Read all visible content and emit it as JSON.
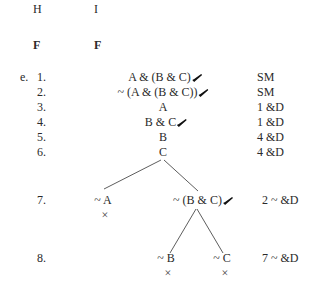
{
  "header": {
    "col1": "H",
    "col2": "I",
    "sub1": "F",
    "sub2": "F"
  },
  "problem": {
    "label": "e.",
    "rows": [
      {
        "num": "1.",
        "formula": "A & (B & C)",
        "checked": true,
        "just": "SM"
      },
      {
        "num": "2.",
        "formula": "~ (A & (B & C))",
        "checked": true,
        "just": "SM"
      },
      {
        "num": "3.",
        "formula": "A",
        "checked": false,
        "just": "1 &D"
      },
      {
        "num": "4.",
        "formula": "B & C",
        "checked": true,
        "just": "1 &D"
      },
      {
        "num": "5.",
        "formula": "B",
        "checked": false,
        "just": "4 &D"
      },
      {
        "num": "6.",
        "formula": "C",
        "checked": false,
        "just": "4 &D"
      }
    ],
    "branch_rows": [
      {
        "num": "7.",
        "left": "~ A",
        "left_closed": true,
        "right": "~ (B & C)",
        "right_checked": true,
        "just": "2 ~ &D"
      },
      {
        "num": "8.",
        "left": "~ B",
        "left_closed": true,
        "right": "~ C",
        "right_closed": true,
        "just": "7 ~ &D"
      }
    ],
    "closed_mark": "×",
    "check_icon": "check-mark-icon"
  }
}
